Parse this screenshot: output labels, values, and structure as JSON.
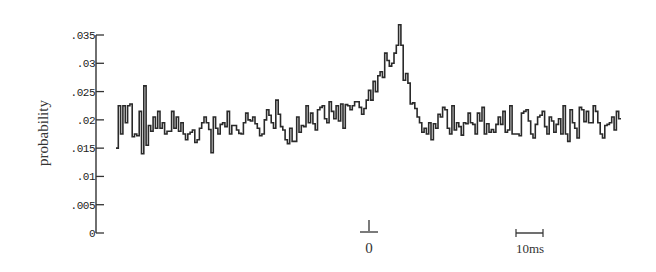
{
  "chart_data": {
    "type": "line",
    "subtype": "step-histogram",
    "title": "",
    "xlabel": "",
    "ylabel": "probability",
    "ylim": [
      0,
      0.035
    ],
    "yticks": [
      0,
      0.005,
      0.01,
      0.015,
      0.02,
      0.025,
      0.03,
      0.035
    ],
    "ytick_labels": [
      "0",
      ".005",
      ".01",
      ".015",
      ".02",
      ".025",
      ".03",
      ".035"
    ],
    "x_marker": {
      "label": "0",
      "position_ms": 0
    },
    "scale_bar": {
      "label": "10ms",
      "length_ms": 10
    },
    "grid": false,
    "x_range_ms": [
      -93,
      92
    ],
    "bin_ms": 1.3,
    "series": [
      {
        "name": "probability",
        "values": [
          0.015,
          0.0225,
          0.0175,
          0.0225,
          0.0195,
          0.0225,
          0.0228,
          0.017,
          0.0175,
          0.0172,
          0.0215,
          0.014,
          0.026,
          0.0155,
          0.019,
          0.018,
          0.0205,
          0.0185,
          0.0215,
          0.0185,
          0.0195,
          0.0175,
          0.018,
          0.018,
          0.0215,
          0.0185,
          0.0205,
          0.018,
          0.0195,
          0.0175,
          0.0165,
          0.0175,
          0.0178,
          0.0182,
          0.016,
          0.0165,
          0.0185,
          0.0195,
          0.0205,
          0.0195,
          0.0183,
          0.0142,
          0.0205,
          0.0185,
          0.0175,
          0.0192,
          0.0195,
          0.0188,
          0.0215,
          0.0175,
          0.019,
          0.019,
          0.0182,
          0.0176,
          0.0175,
          0.0195,
          0.0212,
          0.02,
          0.0198,
          0.0205,
          0.0193,
          0.0185,
          0.0172,
          0.0175,
          0.02,
          0.0218,
          0.0208,
          0.0195,
          0.0185,
          0.0235,
          0.021,
          0.0188,
          0.0182,
          0.0165,
          0.0158,
          0.0185,
          0.0162,
          0.0162,
          0.0205,
          0.0178,
          0.019,
          0.0188,
          0.0225,
          0.0195,
          0.0212,
          0.0193,
          0.0182,
          0.0218,
          0.0222,
          0.0225,
          0.0202,
          0.0195,
          0.0232,
          0.0215,
          0.0202,
          0.0225,
          0.0198,
          0.0228,
          0.0185,
          0.0227,
          0.0225,
          0.0218,
          0.0225,
          0.0232,
          0.0232,
          0.0222,
          0.021,
          0.022,
          0.0235,
          0.0252,
          0.0235,
          0.0268,
          0.025,
          0.0278,
          0.0285,
          0.0275,
          0.0318,
          0.0305,
          0.0295,
          0.03,
          0.0318,
          0.0332,
          0.0368,
          0.0332,
          0.027,
          0.0282,
          0.0265,
          0.0228,
          0.023,
          0.022,
          0.0205,
          0.0195,
          0.0178,
          0.0185,
          0.0175,
          0.0195,
          0.0165,
          0.0193,
          0.0185,
          0.021,
          0.0205,
          0.0222,
          0.0218,
          0.0185,
          0.0175,
          0.0225,
          0.0182,
          0.0195,
          0.0188,
          0.0173,
          0.0195,
          0.0193,
          0.0212,
          0.0195,
          0.0192,
          0.0175,
          0.0212,
          0.0198,
          0.0222,
          0.0175,
          0.0193,
          0.0178,
          0.0183,
          0.0178,
          0.0192,
          0.0205,
          0.0192,
          0.0215,
          0.0178,
          0.0182,
          0.0225,
          0.0175,
          0.0175,
          0.0175,
          0.0172,
          0.0212,
          0.0215,
          0.0218,
          0.0198,
          0.0175,
          0.0168,
          0.0192,
          0.0205,
          0.0208,
          0.0215,
          0.0188,
          0.0175,
          0.0205,
          0.0198,
          0.0178,
          0.0192,
          0.0202,
          0.0175,
          0.0225,
          0.0175,
          0.0162,
          0.0218,
          0.0195,
          0.0185,
          0.0168,
          0.0222,
          0.0218,
          0.0197,
          0.0215,
          0.0195,
          0.0195,
          0.0225,
          0.0215,
          0.0195,
          0.0175,
          0.0168,
          0.019,
          0.0192,
          0.0195,
          0.0205,
          0.0182,
          0.0215,
          0.0202
        ]
      }
    ]
  },
  "axis": {
    "ylabel": "probability",
    "zero_label": "0",
    "scale_label": "10ms"
  }
}
